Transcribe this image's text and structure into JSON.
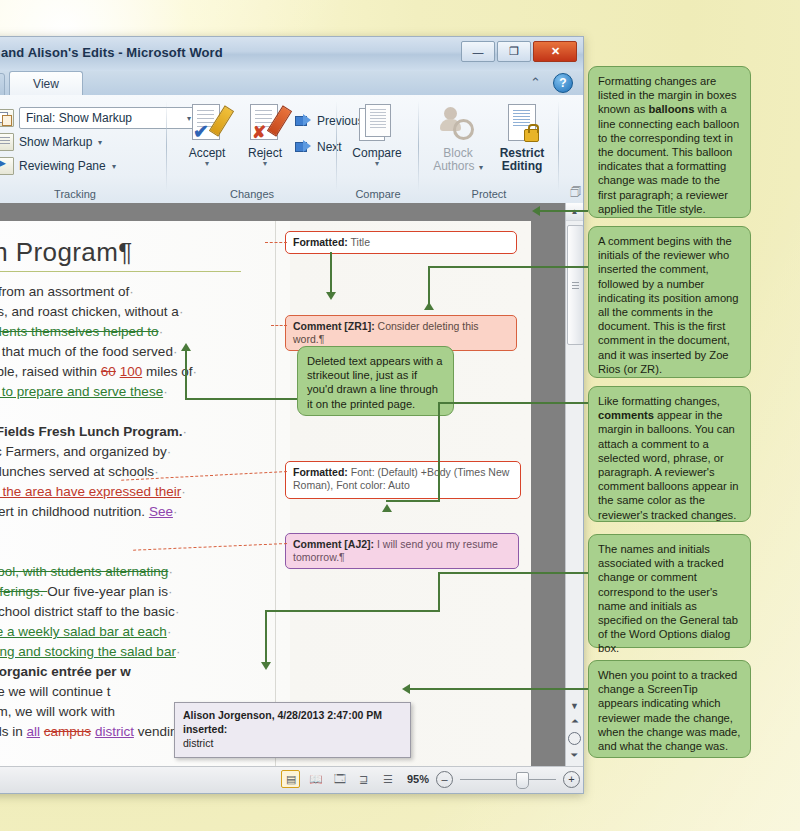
{
  "window": {
    "title": "and Alison's Edits  -  Microsoft Word",
    "minimize_label": "—",
    "restore_label": "❐",
    "close_label": "✕",
    "collapse_ribbon_icon": "chevron-up-icon",
    "help_label": "?"
  },
  "ribbon": {
    "tabs": [
      {
        "label": "View",
        "active": true
      }
    ],
    "groups": [
      {
        "name": "Tracking",
        "label": "Tracking",
        "display_combo": {
          "value": "Final: Show Markup",
          "arrow": "▾"
        },
        "items": [
          {
            "label": "Show Markup",
            "arrow": "▾"
          },
          {
            "label": "Reviewing Pane",
            "arrow": "▾"
          }
        ]
      },
      {
        "name": "Changes",
        "label": "Changes",
        "buttons": [
          {
            "label": "Accept",
            "sub": "▾"
          },
          {
            "label": "Reject",
            "sub": "▾"
          },
          {
            "label": "Previous"
          },
          {
            "label": "Next"
          }
        ]
      },
      {
        "name": "Compare",
        "label": "Compare",
        "buttons": [
          {
            "label": "Compare",
            "sub": "▾"
          }
        ]
      },
      {
        "name": "Protect",
        "label": "Protect",
        "buttons": [
          {
            "label1": "Block",
            "label2": "Authors",
            "arrow": "▾",
            "disabled": true
          },
          {
            "label1": "Restrict",
            "label2": "Editing"
          }
        ]
      }
    ]
  },
  "document": {
    "title": "nch Program¶",
    "lines": [
      {
        "id": "l1",
        "parts": [
          {
            "t": "oose from an assortment of",
            "s": "plain"
          },
          {
            "t": "·",
            "s": "sp"
          }
        ]
      },
      {
        "id": "l2",
        "parts": [
          {
            "t": "dishes, and roast chicken, without a",
            "s": "plain"
          },
          {
            "t": "·",
            "s": "sp"
          }
        ]
      },
      {
        "id": "l3",
        "parts": [
          {
            "t": "e students themselves helped to",
            "s": "del"
          },
          {
            "t": "·",
            "s": "sp"
          }
        ]
      },
      {
        "id": "l4",
        "parts": [
          {
            "t": "agine that much of the food served",
            "s": "plain"
          },
          {
            "t": "·",
            "s": "sp"
          }
        ]
      },
      {
        "id": "l5",
        "parts": [
          {
            "t": "possible, raised within ",
            "s": "plain"
          },
          {
            "t": "60",
            "s": "del-r"
          },
          {
            "t": " ",
            "s": "plain"
          },
          {
            "t": "100",
            "s": "ins-r"
          },
          {
            "t": " miles of",
            "s": "plain"
          },
          {
            "t": "·",
            "s": "sp"
          }
        ]
      },
      {
        "id": "l6",
        "parts": [
          {
            "t": "elped to prepare and serve these",
            "s": "ins"
          },
          {
            "t": "·",
            "s": "sp"
          }
        ]
      },
      {
        "id": "l7",
        "parts": []
      },
      {
        "id": "l8",
        "parts": [
          {
            "t": "reen ",
            "s": "plain"
          },
          {
            "t": "Fields Fresh Lunch Program.",
            "s": "bold"
          },
          {
            "t": "·",
            "s": "sp"
          }
        ]
      },
      {
        "id": "l9",
        "parts": [
          {
            "t": "rganic Farmers, and organized by",
            "s": "plain"
          },
          {
            "t": "·",
            "s": "sp"
          }
        ]
      },
      {
        "id": "l10",
        "parts": [
          {
            "t": "n the lunches served at schools",
            "s": "plain"
          },
          {
            "t": "·",
            "s": "sp"
          }
        ]
      },
      {
        "id": "l11",
        "parts": [
          {
            "t": "ghout the area have expressed their",
            "s": "ins-r"
          },
          {
            "t": "·",
            "s": "sp"
          }
        ]
      },
      {
        "id": "l12",
        "parts": [
          {
            "t": "n expert in childhood nutrition. ",
            "s": "plain"
          },
          {
            "t": "See",
            "s": "ins-p"
          },
          {
            "t": "·",
            "s": "sp"
          }
        ]
      },
      {
        "id": "l13",
        "parts": []
      },
      {
        "id": "l14",
        "parts": []
      },
      {
        "id": "l15",
        "parts": [
          {
            "t": "n school, with students alternating",
            "s": "del"
          },
          {
            "t": "·",
            "s": "sp"
          }
        ]
      },
      {
        "id": "l16",
        "parts": [
          {
            "t": "bar offerings. ",
            "s": "del"
          },
          {
            "t": "Our five-year plan is",
            "s": "plain"
          },
          {
            "t": "·",
            "s": "sp"
          }
        ]
      },
      {
        "id": "l17",
        "parts": [
          {
            "t": "and school district staff to the basic",
            "s": "plain"
          },
          {
            "t": "·",
            "s": "sp"
          }
        ]
      },
      {
        "id": "l18",
        "parts": [
          {
            "t": "eature a weekly salad bar at each",
            "s": "ins"
          },
          {
            "t": "·",
            "s": "sp"
          }
        ]
      },
      {
        "id": "l19",
        "parts": [
          {
            "t": "reparing and stocking the salad bar",
            "s": "ins"
          },
          {
            "t": "·",
            "s": "sp"
          }
        ]
      },
      {
        "id": "l20",
        "parts": [
          {
            "t": "e hot ",
            "s": "plain"
          },
          {
            "t": "organic entrée per w",
            "s": "bold"
          }
        ]
      },
      {
        "id": "l21",
        "parts": [
          {
            "t": "gh five we will continue t",
            "s": "plain"
          }
        ]
      },
      {
        "id": "l22",
        "parts": [
          {
            "t": "rogram, we will work with",
            "s": "plain"
          }
        ]
      },
      {
        "id": "l23",
        "parts": [
          {
            "t": "y foods in ",
            "s": "plain"
          },
          {
            "t": "all",
            "s": "ins-p"
          },
          {
            "t": " ",
            "s": "plain"
          },
          {
            "t": "campus",
            "s": "del-r"
          },
          {
            "t": " ",
            "s": "plain"
          },
          {
            "t": "district",
            "s": "ins-p"
          },
          {
            "t": " vending",
            "s": "plain"
          },
          {
            "t": "·",
            "s": "sp"
          }
        ]
      }
    ]
  },
  "balloons": [
    {
      "id": "fmt1",
      "kind": "formatted",
      "label": "Formatted:",
      "text": " Title"
    },
    {
      "id": "cmt1",
      "kind": "comment-red",
      "label": "Comment [ZR1]:",
      "text": " Consider deleting this word.¶"
    },
    {
      "id": "fmt2",
      "kind": "formatted",
      "label": "Formatted:",
      "text": " Font: (Default) +Body (Times New Roman), Font color: Auto"
    },
    {
      "id": "cmt2",
      "kind": "comment-purple",
      "label": "Comment [AJ2]:",
      "text": " I will send you my resume tomorrow.¶"
    }
  ],
  "screentip": {
    "name": "Alison Jorgenson, 4/28/2013 2:47:00 PM",
    "action": "inserted:",
    "value": "district"
  },
  "statusbar": {
    "view_buttons": [
      {
        "name": "print-layout",
        "glyph": "▤",
        "active": true
      },
      {
        "name": "full-screen-reading",
        "glyph": "📖"
      },
      {
        "name": "web-layout",
        "glyph": "🗔"
      },
      {
        "name": "outline",
        "glyph": "⊒"
      },
      {
        "name": "draft",
        "glyph": "☰"
      }
    ],
    "zoom_label": "95%",
    "zoom_out": "–",
    "zoom_in": "+"
  },
  "callouts": [
    {
      "id": "c1",
      "segments": [
        {
          "t": "Formatting changes are listed in the margin in boxes known as ",
          "b": false
        },
        {
          "t": "balloons",
          "b": true
        },
        {
          "t": " with a line connecting each balloon to the corresponding text in the document. This balloon indicates that a formatting change was made to the first paragraph; a reviewer applied the Title style.",
          "b": false
        }
      ]
    },
    {
      "id": "c2",
      "segments": [
        {
          "t": "A comment begins with the initials of the reviewer who inserted the comment, followed by a number indicating its position among all the comments in the document. This is the first comment in the document, and it was inserted by Zoe Rios (or ZR).",
          "b": false
        }
      ]
    },
    {
      "id": "c3",
      "segments": [
        {
          "t": "Like formatting changes, ",
          "b": false
        },
        {
          "t": "comments",
          "b": true
        },
        {
          "t": " appear in the margin in balloons. You can attach a comment to a selected word, phrase, or paragraph. A reviewer's comment balloons appear in the same color as the reviewer's tracked changes.",
          "b": false
        }
      ]
    },
    {
      "id": "c4",
      "segments": [
        {
          "t": "The names and initials associated with a tracked change or comment correspond to the user's name and initials as specified on the General tab of the Word Options dialog box.",
          "b": false
        }
      ]
    },
    {
      "id": "c5",
      "segments": [
        {
          "t": "When you point to a tracked change a ScreenTip appears indicating which reviewer made the change, when the change was made, and what the change was.",
          "b": false
        }
      ]
    },
    {
      "id": "c6",
      "segments": [
        {
          "t": "Deleted text appears with a strikeout line, just as if you'd drawn a line through it on the printed page.",
          "b": false
        }
      ]
    }
  ]
}
